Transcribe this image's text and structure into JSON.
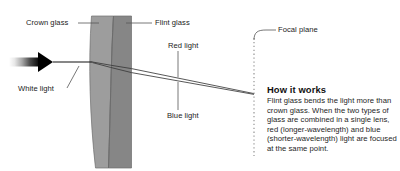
{
  "figure": {
    "background_color": "#ffffff"
  },
  "colors": {
    "crown_glass_fill": "#9d9d9d",
    "flint_glass_fill": "#868686",
    "lens_outline": "#6a6a6a",
    "ray_line": "#3a3a3a",
    "leader_line": "#555555",
    "focal_plane_line": "#8a8a8a",
    "label_text": "#1b1b1b",
    "body_text": "#262626",
    "arrow_dark": "#000000",
    "arrow_light": "#ffffff"
  },
  "labels": {
    "crown_glass": "Crown glass",
    "flint_glass": "Flint glass",
    "red_light": "Red light",
    "blue_light": "Blue light",
    "white_light": "White light",
    "focal_plane": "Focal plane"
  },
  "callout": {
    "title": "How it works",
    "body": "Flint glass bends the light more than crown glass. When the two types of glass are combined in a single lens, red (longer-wavelength) and blue (shorter-wavelength) light are focused at the same point."
  },
  "icons": {
    "incoming_beam": "right-arrow-icon"
  }
}
